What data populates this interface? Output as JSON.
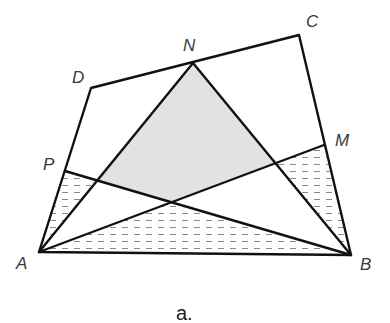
{
  "caption": "a.",
  "labels": {
    "A": "A",
    "B": "B",
    "C": "C",
    "D": "D",
    "M": "M",
    "N": "N",
    "P": "P"
  },
  "points": {
    "A": [
      39,
      252
    ],
    "B": [
      351,
      255
    ],
    "C": [
      299,
      35
    ],
    "D": [
      91,
      88
    ],
    "N": [
      193,
      63
    ],
    "M": [
      324,
      145
    ],
    "P": [
      65,
      171
    ],
    "X_AN_BP": [
      96,
      179
    ],
    "Y_AM_BP": [
      172,
      201
    ],
    "Z_BN_AM": [
      276,
      163
    ]
  },
  "segments": [
    "A-B",
    "B-C",
    "C-D",
    "D-A",
    "A-N",
    "B-N",
    "A-M",
    "B-P"
  ],
  "regions": {
    "gray_quadrilateral": [
      "N",
      "X_AN_BP",
      "Y_AM_BP",
      "Z_BN_AM"
    ],
    "hatched_triangles": [
      [
        "A",
        "P",
        "X_AN_BP"
      ],
      [
        "A",
        "Y_AM_BP",
        "B"
      ],
      [
        "Z_BN_AM",
        "M",
        "B"
      ]
    ]
  },
  "colors": {
    "gray_fill": "#e2e2e2",
    "hatch": "#8a8a8a",
    "stroke": "#111111",
    "label": "#3a3a3a"
  }
}
